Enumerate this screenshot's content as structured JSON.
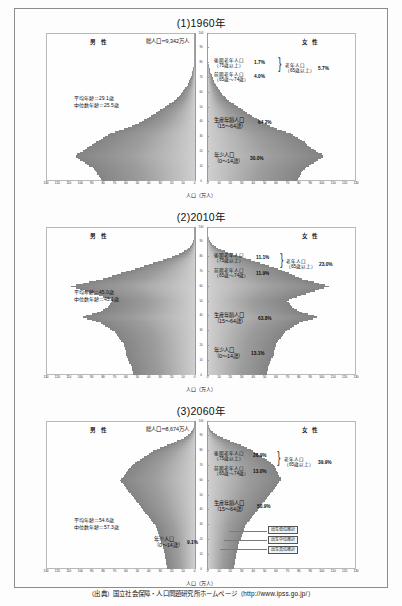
{
  "document": {
    "source_line": "（出典）国立社会保障・人口問題研究所ホームページ（http://www.ipss.go.jp/）"
  },
  "common": {
    "male_label": "男 性",
    "female_label": "女 性",
    "xaxis_label": "人口（万人）",
    "x_ticks_left": [
      "130",
      "120",
      "110",
      "100",
      "90",
      "80",
      "70",
      "60",
      "50",
      "40",
      "30",
      "20",
      "10",
      "0"
    ],
    "x_ticks_right": [
      "0",
      "10",
      "20",
      "30",
      "40",
      "50",
      "60",
      "70",
      "80",
      "90",
      "100",
      "110",
      "120",
      "130"
    ],
    "age_ticks": [
      "100",
      "90",
      "80",
      "70",
      "60",
      "50",
      "40",
      "30",
      "20",
      "10",
      "0"
    ],
    "label_late_old": "後期老年人口",
    "label_late_old_range": "（75歳以上）",
    "label_early_old": "前期老年人口",
    "label_early_old_range": "（65歳～74歳）",
    "label_old": "老年人口",
    "label_old_range": "（65歳以上）",
    "label_working": "生産年齢人口",
    "label_working_range": "（15～64歳）",
    "label_young": "年少人口",
    "label_young_range": "（0～14歳）"
  },
  "charts": [
    {
      "title": "(1)1960年",
      "total_population": "総人口＝9,342万人",
      "mean_age": "平均年齢＝29.1歳",
      "median_age": "中位数年齢＝25.5歳",
      "pct_late_old": "1.7%",
      "pct_early_old": "4.0%",
      "pct_old": "5.7%",
      "pct_working": "64.2%",
      "pct_young": "30.0%",
      "has_projection_legend": false
    },
    {
      "title": "(2)2010年",
      "total_population": "",
      "mean_age": "平均年齢＝45.0歳",
      "median_age": "中位数年齢＝45.1歳",
      "pct_late_old": "11.1%",
      "pct_early_old": "11.9%",
      "pct_old": "23.0%",
      "pct_working": "63.8%",
      "pct_young": "13.1%",
      "has_projection_legend": false
    },
    {
      "title": "(3)2060年",
      "total_population": "総人口＝8,674万人",
      "mean_age": "平均年齢＝54.6歳",
      "median_age": "中位数年齢＝57.3歳",
      "pct_late_old": "26.9%",
      "pct_early_old": "13.0%",
      "pct_old": "39.9%",
      "pct_working": "50.9%",
      "pct_young": "9.1%",
      "has_projection_legend": true,
      "legend_items": [
        "出生低位推計",
        "出生中位推計",
        "出生高位推計"
      ]
    }
  ],
  "chart_data": {
    "type": "bar",
    "subtype": "population-pyramid",
    "xlabel": "人口（万人）",
    "ylabel": "年齢（歳）",
    "xlim": [
      -130,
      130
    ],
    "ylim": [
      0,
      100
    ],
    "grid": false,
    "legend_position": "none",
    "ages": [
      0,
      1,
      2,
      3,
      4,
      5,
      6,
      7,
      8,
      9,
      10,
      11,
      12,
      13,
      14,
      15,
      16,
      17,
      18,
      19,
      20,
      21,
      22,
      23,
      24,
      25,
      26,
      27,
      28,
      29,
      30,
      31,
      32,
      33,
      34,
      35,
      36,
      37,
      38,
      39,
      40,
      41,
      42,
      43,
      44,
      45,
      46,
      47,
      48,
      49,
      50,
      51,
      52,
      53,
      54,
      55,
      56,
      57,
      58,
      59,
      60,
      61,
      62,
      63,
      64,
      65,
      66,
      67,
      68,
      69,
      70,
      71,
      72,
      73,
      74,
      75,
      76,
      77,
      78,
      79,
      80,
      81,
      82,
      83,
      84,
      85,
      86,
      87,
      88,
      89,
      90,
      91,
      92,
      93,
      94,
      95,
      96,
      97,
      98,
      99,
      100
    ],
    "panels": [
      {
        "name": "1960",
        "title": "(1)1960年",
        "total_population_man": 9342,
        "mean_age": 29.1,
        "median_age": 25.5,
        "shares": {
          "young_0_14": 30.0,
          "working_15_64": 64.2,
          "early_old_65_74": 4.0,
          "late_old_75plus": 1.7,
          "old_65plus": 5.7
        },
        "male": [
          81,
          82,
          83,
          84,
          85,
          85,
          86,
          87,
          88,
          89,
          92,
          94,
          96,
          98,
          100,
          102,
          104,
          104,
          103,
          100,
          98,
          96,
          94,
          92,
          90,
          88,
          86,
          84,
          82,
          80,
          78,
          76,
          74,
          70,
          66,
          62,
          58,
          55,
          52,
          49,
          46,
          44,
          42,
          40,
          38,
          36,
          34,
          32,
          30,
          28,
          26,
          24,
          22,
          20,
          18,
          16,
          15,
          14,
          13,
          12,
          11,
          10,
          9,
          8,
          7,
          6,
          5.5,
          5,
          4.5,
          4,
          3.5,
          3,
          2.5,
          2,
          1.8,
          1.5,
          1.2,
          1,
          0.8,
          0.6,
          0.5,
          0.4,
          0.3,
          0.25,
          0.2,
          0.15,
          0.12,
          0.1,
          0.08,
          0.06,
          0.05,
          0.04,
          0.03,
          0.02,
          0.015,
          0.01,
          0.008,
          0.006,
          0.004,
          0.002,
          0.001
        ],
        "female": [
          78,
          79,
          80,
          81,
          82,
          82,
          83,
          84,
          85,
          86,
          89,
          91,
          93,
          95,
          97,
          99,
          101,
          101,
          100,
          97,
          95,
          93,
          91,
          89,
          87,
          86,
          85,
          83,
          81,
          79,
          77,
          75,
          73,
          69,
          65,
          61,
          58,
          55,
          52,
          49,
          47,
          45,
          43,
          41,
          39,
          37,
          35,
          33,
          31,
          29,
          27,
          25,
          23,
          21,
          19,
          17,
          16,
          15,
          14,
          13,
          12,
          11,
          10,
          9,
          8,
          7,
          6.5,
          6,
          5.5,
          5,
          4.5,
          4,
          3.5,
          3,
          2.6,
          2.2,
          1.8,
          1.5,
          1.2,
          1,
          0.8,
          0.65,
          0.5,
          0.4,
          0.3,
          0.25,
          0.2,
          0.15,
          0.12,
          0.1,
          0.08,
          0.06,
          0.05,
          0.04,
          0.03,
          0.02,
          0.015,
          0.01,
          0.007,
          0.005,
          0.003
        ]
      },
      {
        "name": "2010",
        "title": "(2)2010年",
        "total_population_man": null,
        "mean_age": 45.0,
        "median_age": 45.1,
        "shares": {
          "young_0_14": 13.1,
          "working_15_64": 63.8,
          "early_old_65_74": 11.9,
          "late_old_75plus": 11.1,
          "old_65plus": 23.0
        },
        "male": [
          54,
          54,
          54,
          55,
          55,
          55,
          56,
          56,
          57,
          57,
          58,
          58,
          59,
          60,
          60,
          60,
          60,
          61,
          61,
          62,
          62,
          62,
          63,
          64,
          65,
          66,
          67,
          68,
          69,
          70,
          72,
          74,
          76,
          78,
          80,
          82,
          86,
          90,
          94,
          98,
          95,
          90,
          85,
          82,
          80,
          78,
          76,
          75,
          74,
          73,
          72,
          73,
          76,
          80,
          84,
          88,
          92,
          96,
          100,
          104,
          108,
          104,
          98,
          92,
          86,
          80,
          76,
          72,
          68,
          64,
          60,
          56,
          52,
          48,
          44,
          40,
          36,
          32,
          28,
          24,
          20,
          17,
          14,
          11,
          9,
          7,
          5.5,
          4,
          3,
          2.2,
          1.6,
          1.1,
          0.8,
          0.55,
          0.4,
          0.28,
          0.18,
          0.12,
          0.08,
          0.05,
          0.02
        ],
        "female": [
          52,
          52,
          52,
          53,
          53,
          53,
          54,
          54,
          55,
          55,
          56,
          56,
          57,
          58,
          58,
          58,
          58,
          59,
          59,
          60,
          60,
          60,
          61,
          62,
          63,
          64,
          65,
          66,
          67,
          68,
          70,
          72,
          74,
          76,
          78,
          80,
          84,
          88,
          92,
          96,
          93,
          88,
          83,
          80,
          78,
          76,
          74,
          73,
          72,
          71,
          70,
          71,
          74,
          78,
          82,
          86,
          90,
          94,
          98,
          102,
          106,
          103,
          98,
          93,
          88,
          83,
          80,
          77,
          74,
          71,
          68,
          65,
          62,
          58,
          54,
          50,
          46,
          42,
          38,
          34,
          30,
          26,
          22,
          18,
          15,
          12,
          9.5,
          7.5,
          5.5,
          4,
          3,
          2.2,
          1.6,
          1.1,
          0.8,
          0.55,
          0.38,
          0.25,
          0.16,
          0.1,
          0.04
        ]
      },
      {
        "name": "2060",
        "title": "(3)2060年",
        "total_population_man": 8674,
        "mean_age": 54.6,
        "median_age": 57.3,
        "shares": {
          "young_0_14": 9.1,
          "working_15_64": 50.9,
          "early_old_65_74": 13.0,
          "late_old_75plus": 26.9,
          "old_65plus": 39.9
        },
        "male": [
          24,
          24,
          24,
          25,
          25,
          25,
          25,
          26,
          26,
          26,
          26,
          27,
          27,
          27,
          28,
          28,
          28,
          29,
          29,
          29,
          30,
          30,
          31,
          31,
          32,
          32,
          33,
          33,
          34,
          34,
          35,
          36,
          37,
          38,
          39,
          40,
          41,
          42,
          43,
          44,
          45,
          46,
          47,
          48,
          49,
          50,
          51,
          52,
          53,
          54,
          55,
          56,
          57,
          58,
          59,
          60,
          61,
          62,
          63,
          64,
          65,
          64,
          63,
          62,
          61,
          60,
          59,
          58,
          57,
          56,
          55,
          54,
          52,
          50,
          48,
          46,
          44,
          42,
          40,
          38,
          36,
          33,
          30,
          27,
          24,
          21,
          18,
          15,
          12,
          9.5,
          7.2,
          5.4,
          3.9,
          2.7,
          1.8,
          1.2,
          0.8,
          0.5,
          0.3,
          0.15,
          0.06
        ],
        "female": [
          23,
          23,
          23,
          24,
          24,
          24,
          24,
          25,
          25,
          25,
          25,
          26,
          26,
          26,
          27,
          27,
          27,
          28,
          28,
          28,
          29,
          29,
          30,
          30,
          31,
          31,
          32,
          32,
          33,
          33,
          34,
          35,
          36,
          37,
          38,
          39,
          40,
          41,
          42,
          43,
          44,
          45,
          46,
          47,
          48,
          49,
          50,
          51,
          52,
          53,
          54,
          55,
          56,
          57,
          58,
          59,
          60,
          61,
          62,
          63,
          64,
          64,
          64,
          63,
          62,
          62,
          61,
          60,
          60,
          59,
          58,
          57,
          56,
          54,
          52,
          50,
          48,
          46,
          44,
          42,
          40,
          38,
          35,
          32,
          29,
          26,
          23,
          20,
          17,
          14,
          11,
          8.5,
          6.4,
          4.6,
          3.2,
          2.1,
          1.4,
          0.9,
          0.55,
          0.3,
          0.12
        ]
      }
    ]
  }
}
